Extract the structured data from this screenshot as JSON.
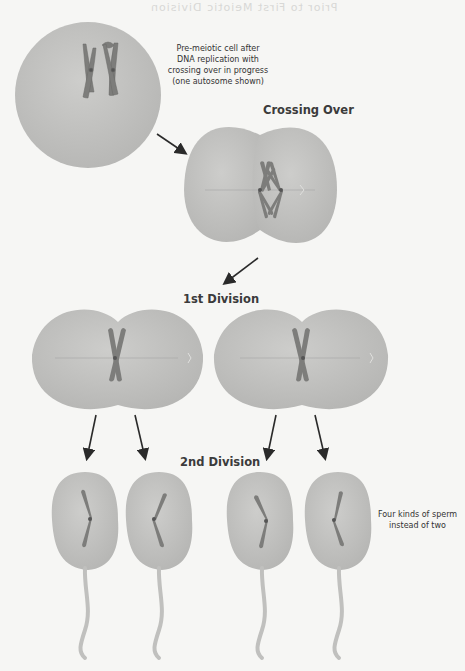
{
  "bleed_through": {
    "heading": "Prior to First Meiotic Division"
  },
  "diagram": {
    "stages": [
      {
        "id": "premeiotic",
        "note": [
          "Pre-meiotic cell after",
          "DNA replication with",
          "crossing over in progress",
          "(one autosome shown)"
        ]
      },
      {
        "id": "crossing-over",
        "title": "Crossing Over"
      },
      {
        "id": "first-division",
        "title": "1st Division"
      },
      {
        "id": "second-division",
        "title": "2nd Division"
      }
    ],
    "result_note": [
      "Four kinds of sperm",
      "instead of two"
    ],
    "colors": {
      "cell_fill": "#c4c4c2",
      "cell_shade": "#b3b3b1",
      "chromosome": "#7a7a78",
      "arrow": "#2a2a2a",
      "background": "#f6f6f4"
    }
  }
}
